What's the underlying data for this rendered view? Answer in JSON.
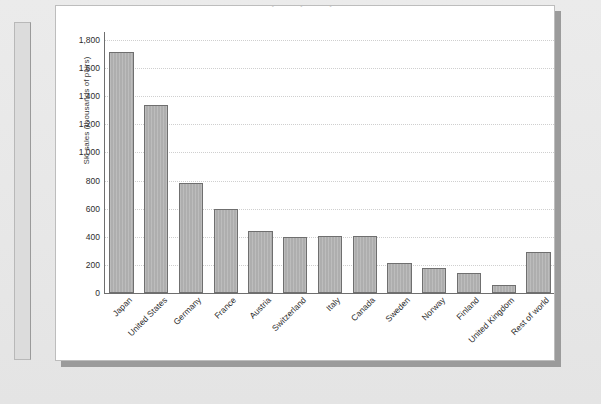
{
  "figure": {
    "title_clipped": "Ski sales by country, latest year available",
    "panel_background": "#ffffff",
    "page_background": "#e9e9e9",
    "shadow_color": "#9b9b9b"
  },
  "chart_data": {
    "type": "bar",
    "title": "Ski sales by country, latest year available",
    "xlabel": "",
    "ylabel": "Ski sales (thousands of pairs)",
    "ylim": [
      0,
      1800
    ],
    "ytick_labels": [
      "0",
      "200",
      "400",
      "600",
      "800",
      "1,000",
      "1,200",
      "1,400",
      "1,600",
      "1,800"
    ],
    "ytick_values": [
      0,
      200,
      400,
      600,
      800,
      1000,
      1200,
      1400,
      1600,
      1800
    ],
    "grid": "horizontal-dotted",
    "legend": "none",
    "bar_color": "#aeaeae",
    "bar_edge_color": "#6f6f6f",
    "categories": [
      "Japan",
      "United States",
      "Germany",
      "France",
      "Austria",
      "Switzerland",
      "Italy",
      "Canada",
      "Sweden",
      "Norway",
      "Finland",
      "United Kingdom",
      "Rest of world"
    ],
    "values": [
      1714,
      1340,
      780,
      600,
      440,
      400,
      405,
      405,
      215,
      180,
      140,
      55,
      290
    ]
  }
}
